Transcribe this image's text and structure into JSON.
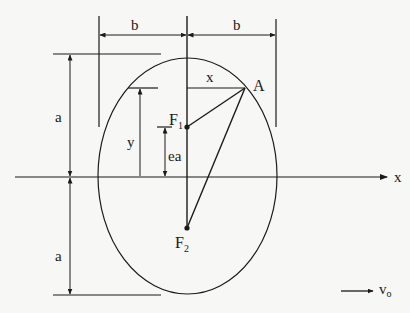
{
  "diagram": {
    "type": "ellipse-geometry",
    "labels": {
      "b_left": "b",
      "b_right": "b",
      "a_top": "a",
      "a_bottom": "a",
      "x_seg": "x",
      "y_seg": "y",
      "ea_seg": "ea",
      "point_a": "A",
      "f1_main": "F",
      "f1_sub": "1",
      "f2_main": "F",
      "f2_sub": "2",
      "x_axis": "x",
      "v0_main": "v",
      "v0_sub": "o"
    },
    "colors": {
      "stroke": "#1a1a1a",
      "background": "#f7f7f5"
    }
  }
}
